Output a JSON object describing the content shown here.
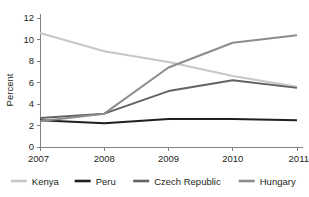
{
  "chart_data": {
    "type": "line",
    "title": "",
    "xlabel": "",
    "ylabel": "Percent",
    "x": [
      "2007",
      "2008",
      "2009",
      "2010",
      "2011"
    ],
    "categories": [
      "2007",
      "2008",
      "2009",
      "2010",
      "2011"
    ],
    "ylim": [
      0,
      12
    ],
    "yticks": [
      0,
      2,
      4,
      6,
      8,
      10,
      12
    ],
    "ytick_labels": [
      "0",
      "2",
      "4",
      "6",
      "8",
      "10",
      "12"
    ],
    "xtick_labels": [
      "2007",
      "2008",
      "2009",
      "2010",
      "2011"
    ],
    "grid": false,
    "legend_position": "bottom",
    "series": [
      {
        "name": "Kenya",
        "color": "#c7c7c7",
        "values": [
          10.6,
          8.9,
          7.9,
          6.6,
          5.6
        ]
      },
      {
        "name": "Peru",
        "color": "#231f20",
        "values": [
          2.5,
          2.2,
          2.6,
          2.6,
          2.5
        ]
      },
      {
        "name": "Czech Republic",
        "color": "#636363",
        "values": [
          2.7,
          3.1,
          5.2,
          6.2,
          5.5
        ]
      },
      {
        "name": "Hungary",
        "color": "#8c8c8c",
        "values": [
          2.4,
          3.1,
          7.4,
          9.7,
          10.4
        ]
      }
    ]
  },
  "axes": {
    "y_title": "Percent"
  },
  "legend": {
    "items": [
      {
        "label": "Kenya"
      },
      {
        "label": "Peru"
      },
      {
        "label": "Czech Republic"
      },
      {
        "label": "Hungary"
      }
    ]
  }
}
